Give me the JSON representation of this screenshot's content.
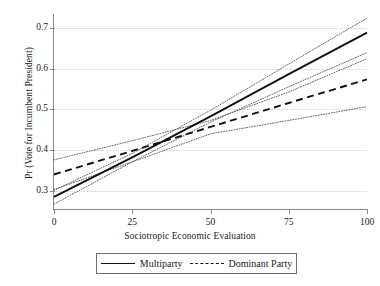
{
  "chart_data": {
    "type": "line",
    "title": "",
    "xlabel": "Sociotropic Economic Evaluation",
    "ylabel": "Pr (Vote for Incumbent President)",
    "xlim": [
      0,
      100
    ],
    "ylim": [
      0.255,
      0.735
    ],
    "xticks": [
      0,
      25,
      50,
      75,
      100
    ],
    "xticklabels": [
      "0",
      "25",
      "50",
      "75",
      "100"
    ],
    "yticks": [
      0.3,
      0.4,
      0.5,
      0.6,
      0.7
    ],
    "yticklabels": [
      "0.3",
      "0.4",
      "0.5",
      "0.6",
      "0.7"
    ],
    "grid": "horizontal",
    "legend_position": "below-axes",
    "x": [
      0,
      25,
      50,
      75,
      100
    ],
    "series": [
      {
        "name": "Multiparty",
        "style": "solid",
        "color": "#111111",
        "values": [
          0.285,
          0.382,
          0.483,
          0.587,
          0.689
        ],
        "ci_upper": {
          "style": "dotted",
          "values": [
            0.301,
            0.392,
            0.498,
            0.612,
            0.725
          ]
        },
        "ci_lower": {
          "style": "dotted",
          "values": [
            0.267,
            0.371,
            0.469,
            0.556,
            0.64
          ]
        }
      },
      {
        "name": "Dominant Party",
        "style": "dashed",
        "color": "#111111",
        "values": [
          0.34,
          0.398,
          0.457,
          0.516,
          0.574
        ],
        "ci_upper": {
          "style": "dotted",
          "values": [
            0.376,
            0.423,
            0.473,
            0.543,
            0.625
          ]
        },
        "ci_lower": {
          "style": "dotted",
          "values": [
            0.303,
            0.371,
            0.44,
            0.473,
            0.507
          ]
        }
      }
    ],
    "legend": [
      {
        "label": "Multiparty",
        "style": "solid"
      },
      {
        "label": "Dominant Party",
        "style": "dashed"
      }
    ],
    "colors": {
      "axis": "#8a8a8a",
      "grid": "#e6e6e6",
      "line": "#111111",
      "ci": "#555555",
      "background": "#ffffff"
    }
  }
}
